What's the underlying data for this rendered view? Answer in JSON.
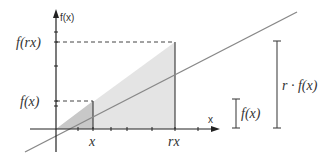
{
  "diagram": {
    "axes": {
      "y_label": "f(x)",
      "x_label": "x"
    },
    "points": {
      "x_label": "x",
      "rx_label": "rx",
      "fx_label": "f(x)",
      "frx_label": "f(rx)"
    },
    "brackets": {
      "small_label": "f(x)",
      "large_label": "r · f(x)"
    },
    "colors": {
      "line": "#888888",
      "axis": "#222222",
      "small_fill": "#c8c8c8",
      "large_fill": "#e4e4e4"
    }
  }
}
